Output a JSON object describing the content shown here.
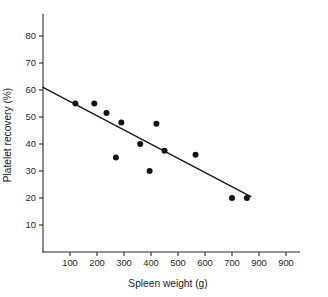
{
  "chart_data": {
    "type": "scatter",
    "title": "",
    "xlabel": "Spleen weight (g)",
    "ylabel": "Platelet recovery (%)",
    "xlim": [
      0,
      950
    ],
    "ylim": [
      0,
      88
    ],
    "grid": false,
    "legend": null,
    "x_ticks": [
      {
        "value": 100,
        "label": "100"
      },
      {
        "value": 200,
        "label": "200"
      },
      {
        "value": 300,
        "label": "300"
      },
      {
        "value": 400,
        "label": "400"
      },
      {
        "value": 500,
        "label": "500"
      },
      {
        "value": 600,
        "label": "600"
      },
      {
        "value": 700,
        "label": "700"
      },
      {
        "value": 800,
        "label": "900"
      },
      {
        "value": 900,
        "label": "900"
      }
    ],
    "y_ticks": [
      {
        "value": 10,
        "label": "10"
      },
      {
        "value": 20,
        "label": "20"
      },
      {
        "value": 30,
        "label": "30"
      },
      {
        "value": 40,
        "label": "40"
      },
      {
        "value": 50,
        "label": "50"
      },
      {
        "value": 60,
        "label": "60"
      },
      {
        "value": 70,
        "label": "70"
      },
      {
        "value": 80,
        "label": "80"
      }
    ],
    "series": [
      {
        "name": "observations",
        "marker": "filled-circle",
        "color": "#141414",
        "points": [
          {
            "x": 120,
            "y": 55.0
          },
          {
            "x": 190,
            "y": 55.0
          },
          {
            "x": 235,
            "y": 51.5
          },
          {
            "x": 270,
            "y": 35.0
          },
          {
            "x": 290,
            "y": 48.0
          },
          {
            "x": 360,
            "y": 40.0
          },
          {
            "x": 395,
            "y": 30.0
          },
          {
            "x": 420,
            "y": 47.5
          },
          {
            "x": 450,
            "y": 37.5
          },
          {
            "x": 565,
            "y": 36.0
          },
          {
            "x": 700,
            "y": 20.0
          },
          {
            "x": 755,
            "y": 20.0
          }
        ]
      }
    ],
    "fit_line": {
      "name": "regression-line",
      "color": "#1a1a1a",
      "x_start": 0,
      "y_start": 61.0,
      "x_end": 770,
      "y_end": 20.5
    }
  }
}
